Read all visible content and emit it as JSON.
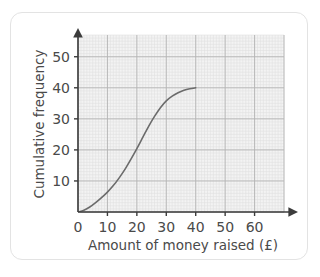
{
  "card": {
    "background": "#ffffff",
    "border_color": "#e3e3e3"
  },
  "chart_data": {
    "type": "line",
    "title": "",
    "subtitle": "",
    "xlabel": "Amount of money raised (£)",
    "ylabel": "Cumulative frequency",
    "xlim": [
      0,
      70
    ],
    "ylim": [
      0,
      57
    ],
    "xticks": [
      0,
      10,
      20,
      30,
      40,
      50,
      60
    ],
    "xtick_labels": [
      "0",
      "10",
      "20",
      "30",
      "40",
      "50",
      "60"
    ],
    "yticks": [
      10,
      20,
      30,
      40,
      50
    ],
    "ytick_labels": [
      "10",
      "20",
      "30",
      "40",
      "50"
    ],
    "grid": true,
    "grid_minor_step_x": 1,
    "grid_minor_step_y": 1,
    "grid_major_step_x": 10,
    "grid_major_step_y": 10,
    "legend": null,
    "legend_position": "none",
    "annotations": [],
    "series": [
      {
        "name": "Cumulative frequency",
        "color": "#6b6b6b",
        "marker": "none",
        "x": [
          0,
          2,
          4,
          6,
          8,
          10,
          12,
          14,
          16,
          18,
          20,
          22,
          24,
          26,
          28,
          30,
          32,
          34,
          36,
          38,
          40
        ],
        "y": [
          0,
          0.6,
          1.6,
          3.0,
          4.6,
          6.4,
          8.5,
          11.0,
          13.8,
          17.0,
          20.4,
          24.0,
          27.6,
          30.8,
          33.6,
          35.8,
          37.3,
          38.4,
          39.2,
          39.7,
          40.0
        ]
      }
    ],
    "colors": {
      "curve": "#6b6b6b",
      "axis": "#3c3c3c",
      "grid_minor": "#e0e0e0",
      "grid_major": "#b4b4b4",
      "plot_background": "#f2f2f2",
      "text": "#4a4a4a"
    }
  }
}
